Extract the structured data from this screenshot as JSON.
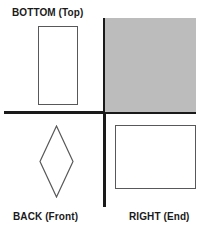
{
  "figure": {
    "title_labels": {
      "top_left": "BOTTOM (Top)",
      "bottom_left": "BACK (Front)",
      "bottom_right": "RIGHT (End)"
    },
    "colors": {
      "background": "#ffffff",
      "axis": "#1a1a1a",
      "shape_outline": "#58585a",
      "shaded_fill": "#bcbcbc",
      "text": "#1a1a1a"
    },
    "quadrants": [
      {
        "name": "top-left",
        "label": "BOTTOM (Top)",
        "shape": "rectangle",
        "filled": false,
        "orientation": "portrait"
      },
      {
        "name": "top-right",
        "label": "",
        "shape": "square",
        "filled": true,
        "fill_color": "#bcbcbc"
      },
      {
        "name": "bottom-left",
        "label": "BACK (Front)",
        "shape": "diamond",
        "filled": false
      },
      {
        "name": "bottom-right",
        "label": "RIGHT (End)",
        "shape": "rectangle",
        "filled": false,
        "orientation": "landscape"
      }
    ],
    "axes": {
      "horizontal": "horizontal-divider",
      "vertical": "vertical-divider"
    }
  }
}
